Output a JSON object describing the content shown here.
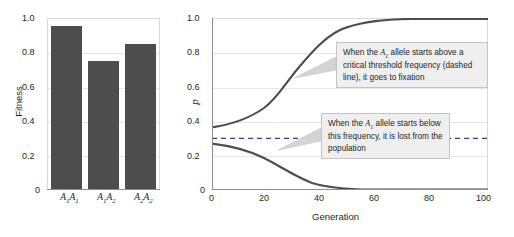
{
  "figure": {
    "panels": [
      "fitness-bar-chart",
      "allele-frequency-trajectories"
    ]
  },
  "left": {
    "ylabel": "Fitness",
    "yticks": [
      "0",
      "0.2",
      "0.4",
      "0.6",
      "0.8",
      "1.0"
    ],
    "bars": [
      {
        "genotype_base1": "A",
        "genotype_sub1": "1",
        "genotype_base2": "A",
        "genotype_sub2": "1",
        "value": 1.0
      },
      {
        "genotype_base1": "A",
        "genotype_sub1": "1",
        "genotype_base2": "A",
        "genotype_sub2": "2",
        "value": 0.79
      },
      {
        "genotype_base1": "A",
        "genotype_sub1": "2",
        "genotype_base2": "A",
        "genotype_sub2": "2",
        "value": 0.89
      }
    ]
  },
  "right": {
    "ylabel": "p",
    "xlabel": "Generation",
    "yticks": [
      "0",
      "0.2",
      "0.4",
      "0.6",
      "0.8",
      "1.0"
    ],
    "xticks": [
      "0",
      "20",
      "40",
      "60",
      "80",
      "100"
    ],
    "callout_1": {
      "line_1_pre": "When the ",
      "line_1_italic": "A",
      "line_1_sub": "1",
      "line_1_post": " allele starts above",
      "line_2": "a critical threshold frequency",
      "line_3": "(dashed line), it goes to fixation"
    },
    "callout_2": {
      "line_1_pre": "When the ",
      "line_1_italic": "A",
      "line_1_sub": "1",
      "line_1_post": " allele starts",
      "line_2": "below this frequency, it is",
      "line_3": "lost from the population"
    }
  },
  "chart_data": [
    {
      "type": "bar",
      "title": "",
      "xlabel": "",
      "ylabel": "Fitness",
      "categories": [
        "A1A1",
        "A1A2",
        "A2A2"
      ],
      "values": [
        1.0,
        0.79,
        0.89
      ],
      "ylim": [
        0,
        1.05
      ],
      "yticks": [
        0,
        0.2,
        0.4,
        0.6,
        0.8,
        1.0
      ],
      "grid": true,
      "legend": "none",
      "bar_color": "#4d4d4d"
    },
    {
      "type": "line",
      "title": "",
      "xlabel": "Generation",
      "ylabel": "p",
      "xlim": [
        0,
        100
      ],
      "ylim": [
        0,
        1.05
      ],
      "xticks": [
        0,
        20,
        40,
        60,
        80,
        100
      ],
      "yticks": [
        0,
        0.2,
        0.4,
        0.6,
        0.8,
        1.0
      ],
      "grid": true,
      "legend": "none",
      "line_color": "#4d4d4d",
      "threshold_line": {
        "value": 0.3,
        "style": "dashed",
        "color": "#3a3a8c"
      },
      "series": [
        {
          "name": "above-threshold-trajectory",
          "x": [
            0,
            5,
            10,
            15,
            20,
            25,
            30,
            35,
            40,
            45,
            50,
            55,
            60,
            70,
            80,
            90,
            100
          ],
          "values": [
            0.33,
            0.35,
            0.38,
            0.42,
            0.47,
            0.54,
            0.62,
            0.72,
            0.81,
            0.89,
            0.94,
            0.97,
            0.99,
            1.0,
            1.0,
            1.0,
            1.0
          ]
        },
        {
          "name": "below-threshold-trajectory",
          "x": [
            0,
            5,
            10,
            15,
            20,
            25,
            30,
            35,
            40,
            45,
            50,
            55,
            60,
            70,
            80,
            90,
            100
          ],
          "values": [
            0.27,
            0.26,
            0.24,
            0.22,
            0.2,
            0.17,
            0.14,
            0.11,
            0.08,
            0.05,
            0.03,
            0.015,
            0.007,
            0.001,
            0.0,
            0.0,
            0.0
          ]
        }
      ],
      "annotations": [
        "When the A1 allele starts above a critical threshold frequency (dashed line), it goes to fixation",
        "When the A1 allele starts below this frequency, it is lost from the population"
      ]
    }
  ]
}
